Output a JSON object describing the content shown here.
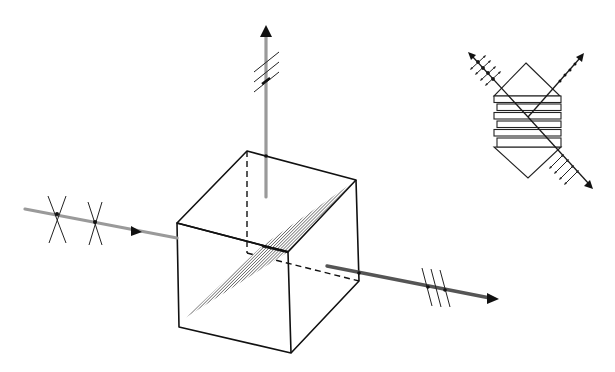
{
  "figure": {
    "colors": {
      "background": "#ffffff",
      "line": "#111111",
      "beam": "#9a9a9a",
      "coating_hatch": "#6a6a6a"
    }
  },
  "cube": {
    "vertices": {
      "back_top_left": [
        247,
        151
      ],
      "back_top_right": [
        356,
        180
      ],
      "front_top_left": [
        177,
        223
      ],
      "front_top_right": [
        288,
        252
      ],
      "back_bottom_left": [
        247,
        253
      ],
      "back_bottom_right": [
        359,
        281
      ],
      "front_bottom_left": [
        179,
        327
      ],
      "front_bottom_right": [
        291,
        353
      ]
    },
    "coating_plane": [
      [
        185,
        318
      ],
      [
        262,
        246
      ],
      [
        352,
        183
      ],
      [
        288,
        252
      ]
    ]
  },
  "beams": {
    "input": {
      "label": "unpolarized input beam",
      "from": [
        25,
        209
      ],
      "to": [
        177,
        238
      ],
      "arrow_at": [
        137,
        231
      ],
      "polarization_marks": "crossed (both polarizations)",
      "marks_at": [
        [
          57,
          214
        ],
        [
          95,
          222
        ]
      ]
    },
    "reflected": {
      "label": "reflected beam (s-polarized)",
      "from": [
        266,
        197
      ],
      "to": [
        266,
        28
      ],
      "polarization_marks": "three slanted parallel lines",
      "marks_y": [
        62,
        72,
        82
      ]
    },
    "transmitted": {
      "label": "transmitted beam (p-polarized)",
      "from": [
        327,
        266
      ],
      "to": [
        497,
        299
      ],
      "polarization_marks": "three vertical parallel lines",
      "marks_x": [
        428,
        437,
        445
      ]
    }
  },
  "inset": {
    "label": "thin-film multilayer beam splitter detail",
    "top_apex": [
      526,
      63
    ],
    "bottom_apex": [
      528,
      178
    ],
    "plate_stack": {
      "left": 494,
      "right": 561,
      "top": 96,
      "bottom": 147,
      "plates": 6
    },
    "incident_ray": {
      "from": [
        470,
        54
      ],
      "to": [
        528,
        117
      ],
      "marks": "double-headed arrows + dots"
    },
    "reflected_ray": {
      "from": [
        528,
        117
      ],
      "to": [
        582,
        55
      ],
      "marks": "dots"
    },
    "transmitted_ray": {
      "from": [
        528,
        117
      ],
      "to": [
        592,
        187
      ],
      "marks": "double-headed arrows"
    }
  }
}
